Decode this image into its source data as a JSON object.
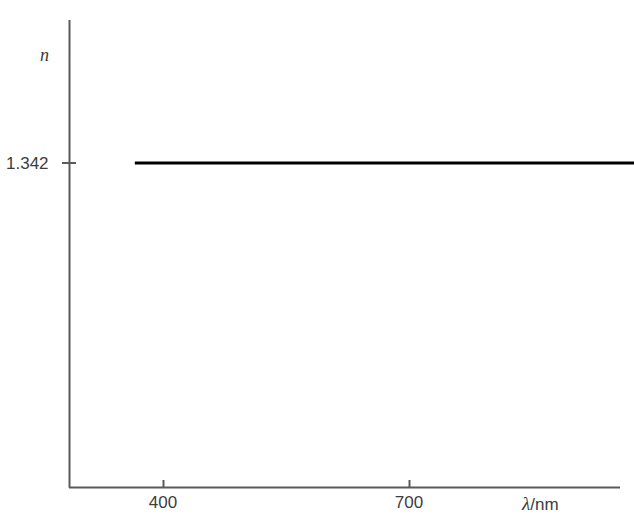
{
  "figure": {
    "background_color": "#ffffff",
    "width": 634,
    "height": 527
  },
  "axes": {
    "y_axis_title": "n",
    "x_axis_title_symbol": "λ",
    "x_axis_title_unit": "/nm",
    "x_axis_title_full": "λ/nm",
    "y_tick_labels": [
      "1.342"
    ],
    "x_tick_labels": [
      "400",
      "700"
    ],
    "axis_color": "#555555",
    "line_color": "#000000"
  },
  "chart_data": {
    "type": "line",
    "title": "",
    "subtitle": "",
    "xlabel": "λ/nm",
    "ylabel": "n",
    "xlim": [
      365,
      1037
    ],
    "ylim": [
      1.3405,
      1.3455
    ],
    "grid": false,
    "legend": null,
    "x_ticks": [
      400,
      700
    ],
    "x_tick_labels": [
      "400",
      "700"
    ],
    "y_ticks": [
      1.342
    ],
    "y_tick_labels": [
      "1.342"
    ],
    "series": [
      {
        "name": "refractive index",
        "color": "#000000",
        "linewidth": 3,
        "x": [
          365,
          400,
          450,
          500,
          550,
          600,
          650,
          700,
          750,
          800,
          850,
          900,
          982
        ],
        "values": [
          1.342,
          1.342,
          1.342,
          1.342,
          1.342,
          1.342,
          1.342,
          1.342,
          1.342,
          1.342,
          1.342,
          1.342,
          1.342
        ]
      }
    ],
    "annotations": []
  }
}
